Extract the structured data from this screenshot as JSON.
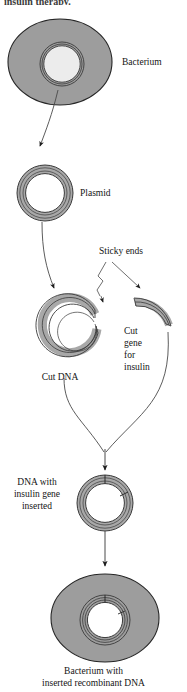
{
  "figure": {
    "title_fragment": "insulin therapy.",
    "caption": {
      "line1": "Bacterium with",
      "line2": "inserted recombinant DNA"
    }
  },
  "labels": {
    "bacterium": "Bacterium",
    "plasmid": "Plasmid",
    "sticky_ends": "Sticky ends",
    "cut_dna": "Cut DNA",
    "cut_gene_1": "Cut",
    "cut_gene_2": "gene",
    "cut_gene_3": "for",
    "cut_gene_4": "insulin",
    "recombinant_1": "DNA with",
    "recombinant_2": "insulin gene",
    "recombinant_3": "inserted"
  },
  "colors": {
    "cell_body": "#9d9d9d",
    "cell_outline": "#2a2a2a",
    "ring_fill": "#a8a8a8",
    "ring_outline": "#3a3a3a",
    "inner_light": "#ececec",
    "inner_white": "#ffffff",
    "arrow": "#555555",
    "text": "#141414",
    "background": "#ffffff"
  },
  "diagram": {
    "type": "process-flow",
    "topic": "Recombinant DNA technology - insulin gene cloning",
    "steps": [
      "Bacterium containing plasmid",
      "Plasmid isolated",
      "Plasmid cut open producing Cut DNA with sticky ends",
      "Cut gene for insulin with sticky ends",
      "DNA with insulin gene inserted (recombinant plasmid)",
      "Bacterium with inserted recombinant DNA"
    ]
  }
}
